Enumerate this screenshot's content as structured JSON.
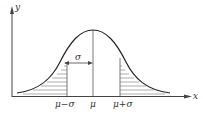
{
  "diagram": {
    "axes": {
      "x_label": "x",
      "y_label": "y"
    },
    "ticks": [
      {
        "label": "μ−σ",
        "x": 67
      },
      {
        "label": "μ",
        "x": 93
      },
      {
        "label": "μ+σ",
        "x": 120
      }
    ],
    "sigma_label": "σ",
    "colors": {
      "line": "#333333",
      "hatch": "#777777",
      "background": "#ffffff"
    }
  }
}
